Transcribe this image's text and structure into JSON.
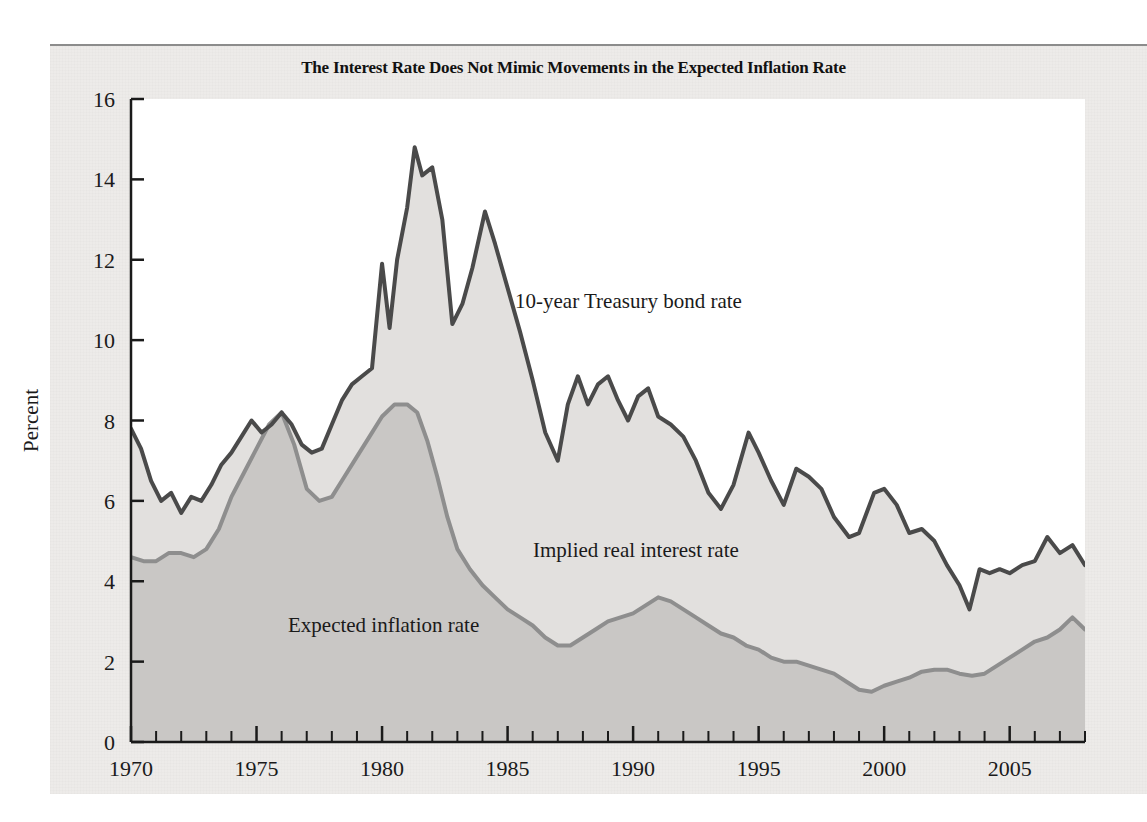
{
  "figure": {
    "title": "The Interest Rate Does Not Mimic Movements in the Expected Inflation Rate",
    "background_color": "#edebe9",
    "plot_background_color": "#ffffff"
  },
  "annotations": {
    "bond": "10-year Treasury bond rate",
    "real": "Implied real interest rate",
    "inflation": "Expected inflation rate"
  },
  "axes": {
    "y_label": "Percent",
    "y_ticks": [
      "0",
      "2",
      "4",
      "6",
      "8",
      "10",
      "12",
      "14",
      "16"
    ],
    "x_ticks": [
      "1970",
      "1975",
      "1980",
      "1985",
      "1990",
      "1995",
      "2000",
      "2005"
    ]
  },
  "chart_data": {
    "type": "area",
    "title": "The Interest Rate Does Not Mimic Movements in the Expected Inflation Rate",
    "xlabel": "",
    "ylabel": "Percent",
    "xlim": [
      1970,
      2008
    ],
    "ylim": [
      0,
      16
    ],
    "grid": false,
    "legend_position": "inline-annotations",
    "x_major_ticks": [
      1970,
      1975,
      1980,
      1985,
      1990,
      1995,
      2000,
      2005
    ],
    "x_minor_tick_step": 1,
    "y_ticks": [
      0,
      2,
      4,
      6,
      8,
      10,
      12,
      14,
      16
    ],
    "band_fill_upper": "#e2e0de",
    "band_fill_lower": "#c9c7c5",
    "series": [
      {
        "name": "10-year Treasury bond rate",
        "color": "#4a4a4a",
        "line_width": 4,
        "x": [
          1970.0,
          1970.4,
          1970.8,
          1971.2,
          1971.6,
          1972.0,
          1972.4,
          1972.8,
          1973.2,
          1973.6,
          1974.0,
          1974.4,
          1974.8,
          1975.2,
          1975.6,
          1976.0,
          1976.4,
          1976.8,
          1977.2,
          1977.6,
          1978.0,
          1978.4,
          1978.8,
          1979.2,
          1979.6,
          1980.0,
          1980.3,
          1980.6,
          1981.0,
          1981.3,
          1981.6,
          1982.0,
          1982.4,
          1982.8,
          1983.2,
          1983.6,
          1984.1,
          1984.5,
          1985.0,
          1985.5,
          1986.0,
          1986.5,
          1987.0,
          1987.4,
          1987.8,
          1988.2,
          1988.6,
          1989.0,
          1989.4,
          1989.8,
          1990.2,
          1990.6,
          1991.0,
          1991.5,
          1992.0,
          1992.5,
          1993.0,
          1993.5,
          1994.0,
          1994.6,
          1995.0,
          1995.5,
          1996.0,
          1996.5,
          1997.0,
          1997.5,
          1998.0,
          1998.6,
          1999.0,
          1999.6,
          2000.0,
          2000.5,
          2001.0,
          2001.5,
          2002.0,
          2002.5,
          2003.0,
          2003.4,
          2003.8,
          2004.2,
          2004.6,
          2005.0,
          2005.5,
          2006.0,
          2006.5,
          2007.0,
          2007.5,
          2008.0
        ],
        "y": [
          7.8,
          7.3,
          6.5,
          6.0,
          6.2,
          5.7,
          6.1,
          6.0,
          6.4,
          6.9,
          7.2,
          7.6,
          8.0,
          7.7,
          7.9,
          8.2,
          7.9,
          7.4,
          7.2,
          7.3,
          7.9,
          8.5,
          8.9,
          9.1,
          9.3,
          11.9,
          10.3,
          12.0,
          13.3,
          14.8,
          14.1,
          14.3,
          13.0,
          10.4,
          10.9,
          11.8,
          13.2,
          12.4,
          11.3,
          10.2,
          9.0,
          7.7,
          7.0,
          8.4,
          9.1,
          8.4,
          8.9,
          9.1,
          8.5,
          8.0,
          8.6,
          8.8,
          8.1,
          7.9,
          7.6,
          7.0,
          6.2,
          5.8,
          6.4,
          7.7,
          7.2,
          6.5,
          5.9,
          6.8,
          6.6,
          6.3,
          5.6,
          5.1,
          5.2,
          6.2,
          6.3,
          5.9,
          5.2,
          5.3,
          5.0,
          4.4,
          3.9,
          3.3,
          4.3,
          4.2,
          4.3,
          4.2,
          4.4,
          4.5,
          5.1,
          4.7,
          4.9,
          4.4
        ]
      },
      {
        "name": "Expected inflation rate",
        "color": "#8e8e8e",
        "line_width": 4,
        "x": [
          1970.0,
          1970.5,
          1971.0,
          1971.5,
          1972.0,
          1972.5,
          1973.0,
          1973.5,
          1974.0,
          1974.5,
          1975.0,
          1975.5,
          1976.0,
          1976.5,
          1977.0,
          1977.5,
          1978.0,
          1978.5,
          1979.0,
          1979.5,
          1980.0,
          1980.5,
          1981.0,
          1981.4,
          1981.8,
          1982.2,
          1982.6,
          1983.0,
          1983.5,
          1984.0,
          1984.5,
          1985.0,
          1985.5,
          1986.0,
          1986.5,
          1987.0,
          1987.5,
          1988.0,
          1988.5,
          1989.0,
          1989.5,
          1990.0,
          1990.5,
          1991.0,
          1991.5,
          1992.0,
          1992.5,
          1993.0,
          1993.5,
          1994.0,
          1994.5,
          1995.0,
          1995.5,
          1996.0,
          1996.5,
          1997.0,
          1997.5,
          1998.0,
          1998.5,
          1999.0,
          1999.5,
          2000.0,
          2000.5,
          2001.0,
          2001.5,
          2002.0,
          2002.5,
          2003.0,
          2003.5,
          2004.0,
          2004.5,
          2005.0,
          2005.5,
          2006.0,
          2006.5,
          2007.0,
          2007.5,
          2008.0
        ],
        "y": [
          4.6,
          4.5,
          4.5,
          4.7,
          4.7,
          4.6,
          4.8,
          5.3,
          6.1,
          6.7,
          7.3,
          7.9,
          8.2,
          7.4,
          6.3,
          6.0,
          6.1,
          6.6,
          7.1,
          7.6,
          8.1,
          8.4,
          8.4,
          8.2,
          7.5,
          6.6,
          5.6,
          4.8,
          4.3,
          3.9,
          3.6,
          3.3,
          3.1,
          2.9,
          2.6,
          2.4,
          2.4,
          2.6,
          2.8,
          3.0,
          3.1,
          3.2,
          3.4,
          3.6,
          3.5,
          3.3,
          3.1,
          2.9,
          2.7,
          2.6,
          2.4,
          2.3,
          2.1,
          2.0,
          2.0,
          1.9,
          1.8,
          1.7,
          1.5,
          1.3,
          1.25,
          1.4,
          1.5,
          1.6,
          1.75,
          1.8,
          1.8,
          1.7,
          1.65,
          1.7,
          1.9,
          2.1,
          2.3,
          2.5,
          2.6,
          2.8,
          3.1,
          2.8
        ]
      }
    ]
  }
}
